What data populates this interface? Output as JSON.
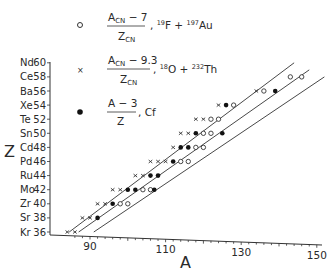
{
  "chart_data": {
    "type": "scatter",
    "title": "",
    "xlabel": "A",
    "ylabel": "Z",
    "xlim": [
      83,
      151
    ],
    "ylim": [
      35,
      61
    ],
    "grid": false,
    "legend_position": "top-left (inside)",
    "x_ticks": [
      90,
      110,
      130,
      150
    ],
    "y_ticks": [
      {
        "value": 36,
        "element": "Kr"
      },
      {
        "value": 38,
        "element": "Sr"
      },
      {
        "value": 40,
        "element": "Zr"
      },
      {
        "value": 42,
        "element": "Mo"
      },
      {
        "value": 44,
        "element": "Ru"
      },
      {
        "value": 46,
        "element": "Pd"
      },
      {
        "value": 48,
        "element": "Cd"
      },
      {
        "value": 50,
        "element": "Sn"
      },
      {
        "value": 52,
        "element": "Te"
      },
      {
        "value": 54,
        "element": "Xe"
      },
      {
        "value": 56,
        "element": "Ba"
      },
      {
        "value": 58,
        "element": "Ce"
      },
      {
        "value": 60,
        "element": "Nd"
      }
    ],
    "legend": [
      {
        "marker": "open-circle",
        "numerator": "A_CN − 7",
        "denominator": "Z_CN",
        "reaction": "19F + 197Au"
      },
      {
        "marker": "cross",
        "numerator": "A_CN − 9.3",
        "denominator": "Z_CN",
        "reaction": "18O + 232Th"
      },
      {
        "marker": "filled-circle",
        "numerator": "A − 3",
        "denominator": "Z",
        "reaction": "Cf"
      }
    ],
    "series": [
      {
        "name": "19F + 197Au",
        "marker": "open-circle",
        "points": [
          [
            98,
            40
          ],
          [
            100,
            40
          ],
          [
            104,
            42
          ],
          [
            106,
            42
          ],
          [
            114,
            46
          ],
          [
            116,
            46
          ],
          [
            118,
            48
          ],
          [
            120,
            48
          ],
          [
            120,
            50
          ],
          [
            122,
            50
          ],
          [
            122,
            52
          ],
          [
            124,
            52
          ],
          [
            128,
            54
          ],
          [
            136,
            56
          ],
          [
            143,
            58
          ],
          [
            146,
            58
          ]
        ]
      },
      {
        "name": "18O + 232Th",
        "marker": "cross",
        "points": [
          [
            84,
            36
          ],
          [
            86,
            36
          ],
          [
            88,
            38
          ],
          [
            90,
            38
          ],
          [
            92,
            40
          ],
          [
            94,
            40
          ],
          [
            96,
            42
          ],
          [
            98,
            42
          ],
          [
            102,
            44
          ],
          [
            104,
            44
          ],
          [
            106,
            46
          ],
          [
            108,
            46
          ],
          [
            110,
            46
          ],
          [
            112,
            48
          ],
          [
            114,
            50
          ],
          [
            116,
            50
          ],
          [
            118,
            52
          ],
          [
            120,
            52
          ],
          [
            124,
            54
          ],
          [
            134,
            56
          ]
        ]
      },
      {
        "name": "Cf",
        "marker": "filled-circle",
        "points": [
          [
            92,
            38
          ],
          [
            96,
            40
          ],
          [
            100,
            42
          ],
          [
            102,
            42
          ],
          [
            107,
            42
          ],
          [
            106,
            44
          ],
          [
            108,
            44
          ],
          [
            112,
            46
          ],
          [
            114,
            48
          ],
          [
            116,
            48
          ],
          [
            118,
            50
          ],
          [
            125,
            50
          ],
          [
            126,
            54
          ],
          [
            139,
            56
          ]
        ]
      }
    ],
    "lines": [
      {
        "label": "upper fit",
        "from": [
          84.5,
          36
        ],
        "to": [
          144,
          60
        ]
      },
      {
        "label": "middle fit",
        "from": [
          87,
          36
        ],
        "to": [
          148,
          59
        ]
      },
      {
        "label": "lower fit",
        "from": [
          91,
          36
        ],
        "to": [
          152,
          58
        ]
      }
    ]
  },
  "axes": {
    "x_label": "A",
    "y_label": "Z",
    "x_tick_labels": [
      "90",
      "110",
      "130",
      "150"
    ],
    "y_tick_labels": [
      "Nd 60",
      "Ce 58",
      "Ba 56",
      "Xe 54",
      "Te 52",
      "Sn 50",
      "Cd 48",
      "Pd 46",
      "Ru 44",
      "Mo 42",
      "Zr 40",
      "Sr 38",
      "Kr 36"
    ]
  },
  "legend": {
    "item1": {
      "num": "A",
      "num_sub": "CN",
      "num_rest": " − 7",
      "den": "Z",
      "den_sub": "CN",
      "reaction_pre": ", ",
      "r1_mass": "19",
      "r1_el": "F",
      "plus": " + ",
      "r2_mass": "197",
      "r2_el": "Au"
    },
    "item2": {
      "num": "A",
      "num_sub": "CN",
      "num_rest": " − 9.3",
      "den": "Z",
      "den_sub": "CN",
      "r1_mass": "18",
      "r1_el": "O",
      "plus": " + ",
      "r2_mass": "232",
      "r2_el": "Th"
    },
    "item3": {
      "num": "A − 3",
      "den": "Z",
      "reaction": "Cf"
    }
  }
}
